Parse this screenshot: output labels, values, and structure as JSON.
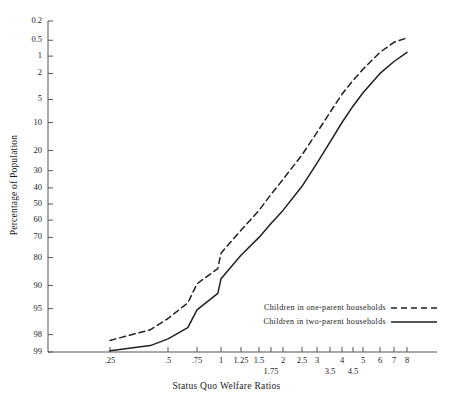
{
  "chart_data": {
    "type": "line",
    "title": "",
    "xlabel": "Status Quo Welfare Ratios",
    "ylabel": "Percentage of Population",
    "xscale": "log",
    "yscale": "probability",
    "grid": false,
    "legend_position": "bottom-right",
    "xlim": [
      0.25,
      8
    ],
    "ylim": [
      0.2,
      99
    ],
    "xticks": [
      {
        "value": 0.25,
        "label": ".25",
        "row": 1
      },
      {
        "value": 0.5,
        "label": ".5",
        "row": 1
      },
      {
        "value": 0.75,
        "label": ".75",
        "row": 1
      },
      {
        "value": 1,
        "label": "1",
        "row": 1
      },
      {
        "value": 1.25,
        "label": "1.25",
        "row": 1
      },
      {
        "value": 1.5,
        "label": "1.5",
        "row": 1
      },
      {
        "value": 1.75,
        "label": "1.75",
        "row": 2
      },
      {
        "value": 2,
        "label": "2",
        "row": 1
      },
      {
        "value": 2.5,
        "label": "2.5",
        "row": 1
      },
      {
        "value": 3,
        "label": "3",
        "row": 1
      },
      {
        "value": 3.5,
        "label": "3.5",
        "row": 2
      },
      {
        "value": 4,
        "label": "4",
        "row": 1
      },
      {
        "value": 4.5,
        "label": "4.5",
        "row": 2
      },
      {
        "value": 5,
        "label": "5",
        "row": 1
      },
      {
        "value": 6,
        "label": "6",
        "row": 1
      },
      {
        "value": 7,
        "label": "7",
        "row": 1
      },
      {
        "value": 8,
        "label": "8",
        "row": 1
      }
    ],
    "yticks": [
      {
        "value": 0.2,
        "label": "0.2"
      },
      {
        "value": 0.5,
        "label": "0.5"
      },
      {
        "value": 1,
        "label": "1"
      },
      {
        "value": 2,
        "label": "2"
      },
      {
        "value": 5,
        "label": "5"
      },
      {
        "value": 10,
        "label": "10"
      },
      {
        "value": 20,
        "label": "20"
      },
      {
        "value": 30,
        "label": "30"
      },
      {
        "value": 40,
        "label": "40"
      },
      {
        "value": 50,
        "label": "50"
      },
      {
        "value": 60,
        "label": "60"
      },
      {
        "value": 70,
        "label": "70"
      },
      {
        "value": 80,
        "label": "80"
      },
      {
        "value": 90,
        "label": "90"
      },
      {
        "value": 95,
        "label": "95"
      },
      {
        "value": 98,
        "label": "98"
      },
      {
        "value": 99,
        "label": "99"
      }
    ],
    "series": [
      {
        "name": "Children in one-parent households",
        "style": "dashed",
        "color": "#202020",
        "points": [
          {
            "x": 0.25,
            "y": 98.4
          },
          {
            "x": 0.4,
            "y": 97.6
          },
          {
            "x": 0.5,
            "y": 96.4
          },
          {
            "x": 0.62,
            "y": 94.0
          },
          {
            "x": 0.75,
            "y": 89.5
          },
          {
            "x": 0.88,
            "y": 84.5
          },
          {
            "x": 1.0,
            "y": 78.0
          },
          {
            "x": 1.25,
            "y": 66.0
          },
          {
            "x": 1.5,
            "y": 54.0
          },
          {
            "x": 1.75,
            "y": 44.0
          },
          {
            "x": 2.0,
            "y": 35.0
          },
          {
            "x": 2.5,
            "y": 22.0
          },
          {
            "x": 3.0,
            "y": 13.0
          },
          {
            "x": 3.5,
            "y": 7.5
          },
          {
            "x": 4.0,
            "y": 4.2
          },
          {
            "x": 4.5,
            "y": 2.6
          },
          {
            "x": 5.0,
            "y": 1.7
          },
          {
            "x": 6.0,
            "y": 0.85
          },
          {
            "x": 7.0,
            "y": 0.55
          },
          {
            "x": 8.0,
            "y": 0.45
          }
        ]
      },
      {
        "name": "Children in two-parent households",
        "style": "solid",
        "color": "#202020",
        "points": [
          {
            "x": 0.25,
            "y": 98.95
          },
          {
            "x": 0.4,
            "y": 98.7
          },
          {
            "x": 0.5,
            "y": 98.3
          },
          {
            "x": 0.62,
            "y": 97.4
          },
          {
            "x": 0.75,
            "y": 95.2
          },
          {
            "x": 0.88,
            "y": 92.0
          },
          {
            "x": 1.0,
            "y": 88.0
          },
          {
            "x": 1.25,
            "y": 79.0
          },
          {
            "x": 1.5,
            "y": 70.0
          },
          {
            "x": 1.75,
            "y": 62.0
          },
          {
            "x": 2.0,
            "y": 54.0
          },
          {
            "x": 2.5,
            "y": 39.0
          },
          {
            "x": 3.0,
            "y": 26.0
          },
          {
            "x": 3.5,
            "y": 16.5
          },
          {
            "x": 4.0,
            "y": 10.0
          },
          {
            "x": 4.5,
            "y": 6.2
          },
          {
            "x": 5.0,
            "y": 4.0
          },
          {
            "x": 6.0,
            "y": 2.0
          },
          {
            "x": 7.0,
            "y": 1.25
          },
          {
            "x": 8.0,
            "y": 0.85
          }
        ]
      }
    ]
  },
  "legend": {
    "items": [
      {
        "label": "Children in one-parent households",
        "style": "dashed"
      },
      {
        "label": "Children in two-parent households",
        "style": "solid"
      }
    ]
  },
  "axes": {
    "x_title": "Status Quo Welfare Ratios",
    "y_title": "Percentage of Population"
  }
}
